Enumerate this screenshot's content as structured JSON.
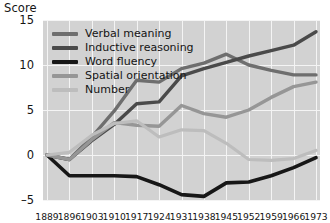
{
  "chart_data": {
    "type": "line",
    "title": "",
    "ylabel": "Score",
    "xlabel": "",
    "ylim": [
      -5,
      15
    ],
    "yticks": [
      15,
      10,
      5,
      0,
      -5
    ],
    "grid": true,
    "legend_position": "top-left",
    "categories": [
      "1889",
      "1896",
      "1903",
      "1910",
      "1917",
      "1924",
      "1931",
      "1938",
      "1945",
      "1952",
      "1959",
      "1966",
      "1973"
    ],
    "series": [
      {
        "name": "Verbal meaning",
        "color": "#6e6e6e",
        "values": [
          0.0,
          -0.5,
          2.0,
          4.9,
          8.3,
          8.1,
          9.6,
          10.2,
          11.2,
          10.0,
          9.4,
          8.9,
          8.9
        ]
      },
      {
        "name": "Inductive reasoning",
        "color": "#4a4a4a",
        "values": [
          0.0,
          -0.5,
          1.6,
          3.4,
          5.7,
          5.9,
          8.8,
          9.6,
          10.3,
          11.0,
          11.6,
          12.2,
          13.7
        ]
      },
      {
        "name": "Word fluency",
        "color": "#171717",
        "values": [
          0.0,
          -2.3,
          -2.3,
          -2.3,
          -2.4,
          -3.3,
          -4.4,
          -4.6,
          -3.1,
          -3.0,
          -2.3,
          -1.4,
          -0.3
        ]
      },
      {
        "name": "Spatial orientation",
        "color": "#969696",
        "values": [
          0.0,
          -0.5,
          1.7,
          3.6,
          3.3,
          3.2,
          5.5,
          4.6,
          4.2,
          5.0,
          6.4,
          7.6,
          8.1
        ]
      },
      {
        "name": "Number",
        "color": "#bdbdbd",
        "values": [
          0.0,
          0.3,
          2.2,
          3.5,
          3.8,
          2.0,
          2.8,
          2.7,
          1.3,
          -0.5,
          -0.6,
          -0.4,
          0.5
        ]
      }
    ]
  }
}
